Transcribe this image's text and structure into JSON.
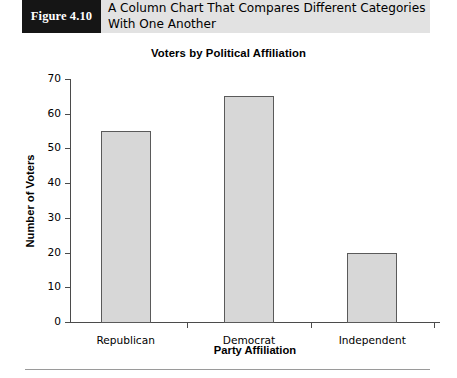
{
  "figure": {
    "tag": "Figure 4.10",
    "caption": "A Column Chart That Compares Different Categories With One Another"
  },
  "chart_data": {
    "type": "bar",
    "title": "Voters by Political Affiliation",
    "xlabel": "Party Affiliation",
    "ylabel": "Number of Voters",
    "categories": [
      "Republican",
      "Democrat",
      "Independent"
    ],
    "values": [
      55,
      65,
      20
    ],
    "ylim": [
      0,
      70
    ],
    "yticks": [
      0,
      10,
      20,
      30,
      40,
      50,
      60,
      70
    ],
    "ytick_labels": [
      "0",
      "10",
      "20",
      "30",
      "40",
      "50",
      "60",
      "70"
    ],
    "grid": false,
    "legend": false,
    "bar_fill": "#d7d7d7",
    "bar_border": "#5a5a5a",
    "axis_color": "#4b4b4b"
  }
}
